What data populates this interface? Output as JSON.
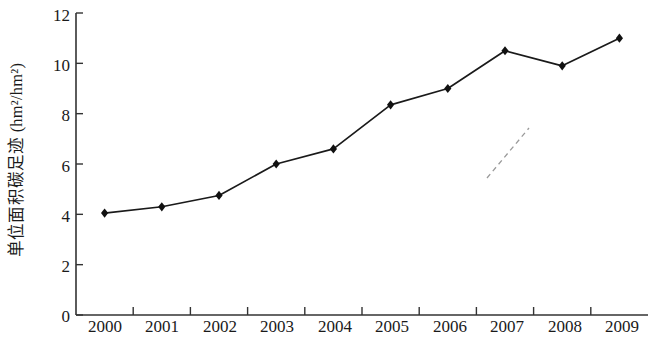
{
  "chart_data": {
    "type": "line",
    "title": "",
    "xlabel": "",
    "ylabel": "单位面积碳足迹 (hm²/hm²)",
    "categories": [
      "2000",
      "2001",
      "2002",
      "2003",
      "2004",
      "2005",
      "2006",
      "2007",
      "2008",
      "2009"
    ],
    "values": [
      4.05,
      4.3,
      4.75,
      6.0,
      6.6,
      8.35,
      9.0,
      10.5,
      9.9,
      11.0
    ],
    "series": [
      {
        "name": "单位面积碳足迹",
        "values": [
          4.05,
          4.3,
          4.75,
          6.0,
          6.6,
          8.35,
          9.0,
          10.5,
          9.9,
          11.0
        ]
      }
    ],
    "ylim": [
      0,
      12
    ],
    "ytick_values": [
      0,
      2,
      4,
      6,
      8,
      10,
      12
    ],
    "ytick_labels": [
      "0",
      "2",
      "4",
      "6",
      "8",
      "10",
      "12"
    ],
    "xtick_labels": [
      "2000",
      "2001",
      "2002",
      "2003",
      "2004",
      "2005",
      "2006",
      "2007",
      "2008",
      "2009"
    ],
    "grid": false,
    "legend": false,
    "legend_position": "none",
    "marker": "diamond",
    "line_color": "#1a1a1a",
    "marker_color": "#111111",
    "axis_color": "#333333",
    "background_color": "#ffffff",
    "annotations": [
      {
        "name": "scan-artifact-dashed-line",
        "style": "dashed",
        "from": [
          487,
          178
        ],
        "to": [
          529,
          128
        ]
      }
    ]
  }
}
